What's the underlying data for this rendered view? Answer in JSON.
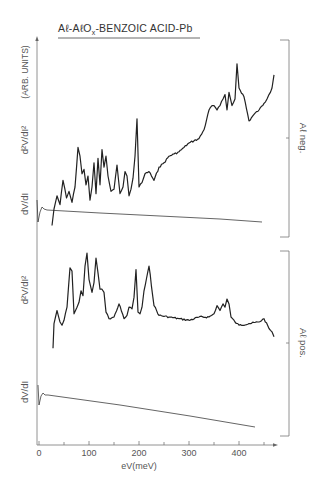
{
  "chart_data": {
    "type": "line",
    "title": "Aℓ-AℓOx-BENZOIC ACID-Pb",
    "title_parts": {
      "main1": "Aℓ-AℓO",
      "sub": "x",
      "main2": "-BENZOIC ACID-Pb"
    },
    "xlabel": "eV(meV)",
    "ylabel": "(ARB. UNITS)",
    "xlim": [
      0,
      470
    ],
    "x_ticks": [
      0,
      100,
      200,
      300,
      400
    ],
    "x_minor_ticks": [
      50,
      150,
      250,
      350,
      450
    ],
    "grid": false,
    "panels": [
      {
        "name": "Aℓ neg.",
        "label": "Aℓ neg.",
        "series": [
          {
            "name": "d²V/dI²",
            "label": "d²V/dI²",
            "x": [
              26,
              30,
              36,
              42,
              48,
              55,
              60,
              66,
              72,
              78,
              82,
              86,
              90,
              94,
              98,
              102,
              106,
              110,
              114,
              118,
              122,
              126,
              130,
              134,
              138,
              144,
              150,
              156,
              162,
              168,
              172,
              176,
              180,
              184,
              188,
              192,
              196,
              200,
              206,
              212,
              220,
              230,
              240,
              250,
              260,
              270,
              280,
              290,
              300,
              310,
              320,
              330,
              340,
              346,
              350,
              356,
              362,
              368,
              372,
              376,
              380,
              386,
              392,
              396,
              400,
              410,
              420,
              430,
              440,
              450,
              456,
              460,
              466,
              470
            ],
            "y": [
              -5,
              10,
              22,
              14,
              36,
              20,
              26,
              16,
              30,
              66,
              58,
              42,
              46,
              32,
              40,
              18,
              30,
              52,
              24,
              56,
              32,
              64,
              48,
              58,
              40,
              26,
              28,
              50,
              24,
              30,
              44,
              40,
              22,
              28,
              38,
              58,
              92,
              30,
              34,
              42,
              44,
              36,
              48,
              52,
              58,
              60,
              62,
              66,
              70,
              72,
              74,
              82,
              100,
              104,
              104,
              100,
              104,
              110,
              114,
              100,
              116,
              104,
              110,
              142,
              120,
              112,
              90,
              96,
              100,
              106,
              110,
              114,
              120,
              132
            ]
          },
          {
            "name": "dV/dI",
            "label": "dV/dI",
            "shape": "initial dip near 0 meV then slowly decreasing line"
          }
        ]
      },
      {
        "name": "Aℓ pos.",
        "label": "Aℓ pos.",
        "series": [
          {
            "name": "d²V/dI²",
            "label": "d²V/dI²",
            "x": [
              28,
              30,
              36,
              42,
              46,
              50,
              56,
              62,
              66,
              70,
              76,
              80,
              84,
              88,
              92,
              96,
              100,
              106,
              110,
              114,
              118,
              122,
              126,
              130,
              134,
              140,
              150,
              160,
              170,
              176,
              180,
              186,
              190,
              194,
              198,
              202,
              206,
              210,
              220,
              230,
              240,
              260,
              280,
              300,
              320,
              340,
              350,
              356,
              362,
              368,
              372,
              376,
              380,
              384,
              392,
              400,
              420,
              440,
              450,
              460,
              466,
              470
            ],
            "y": [
              -10,
              20,
              36,
              22,
              18,
              24,
              40,
              88,
              84,
              32,
              40,
              46,
              60,
              54,
              90,
              106,
              74,
              58,
              70,
              100,
              82,
              62,
              62,
              58,
              34,
              26,
              28,
              44,
              26,
              30,
              40,
              38,
              52,
              86,
              34,
              32,
              40,
              60,
              90,
              42,
              30,
              28,
              26,
              24,
              28,
              28,
              32,
              42,
              36,
              44,
              40,
              50,
              44,
              28,
              22,
              18,
              20,
              22,
              26,
              14,
              10,
              4
            ]
          },
          {
            "name": "dV/dI",
            "label": "dV/dI",
            "shape": "initial dip near 0 meV then slowly decreasing line"
          }
        ]
      }
    ],
    "annotations": [
      "Aℓ neg.",
      "Aℓ pos."
    ]
  },
  "labels": {
    "title_main1": "Aℓ-AℓO",
    "title_sub": "x",
    "title_main2": "-BENZOIC ACID-Pb",
    "y_units": "(ARB. UNITS)",
    "upper_d2": "d²V/dI²",
    "upper_d1": "dV/dI",
    "lower_d2": "d²V/dI²",
    "lower_d1": "dV/dI",
    "upper_bracket": "Aℓ neg.",
    "lower_bracket": "Aℓ pos.",
    "xlabel": "eV(meV)",
    "ticks": [
      "0",
      "100",
      "200",
      "300",
      "400"
    ]
  }
}
